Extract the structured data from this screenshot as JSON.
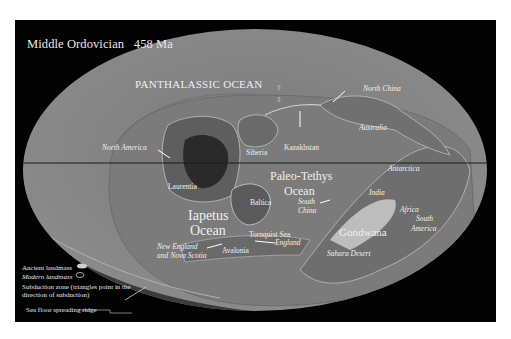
{
  "title": "Middle Ordovician   458 Ma",
  "colors": {
    "background": "#020202",
    "outer_ocean": "#888888",
    "inner_ocean": "#787878",
    "land": "#6a6a6a",
    "ancient_land_dark": "#2e2e2e",
    "gondwana_light": "#bdbdbd",
    "label": "#efefef",
    "equator_line": "#1a1a1a"
  },
  "oceans": {
    "panthalassic": "PANTHALASSIC OCEAN",
    "paleo_tethys_1": "Paleo-Tethys",
    "paleo_tethys_2": "Ocean",
    "iapetus_1": "Iapetus",
    "iapetus_2": "Ocean",
    "tornquist": "Tornquist Sea"
  },
  "ancient_landmasses": {
    "laurentia": "Laurentia",
    "siberia": "Siberia",
    "kazakhstan": "Kazakhstan",
    "baltica": "Baltica",
    "avalonia": "Avalonia",
    "gondwana": "Gondwana"
  },
  "modern_landmasses": {
    "north_america": "North America",
    "north_china": "North China",
    "australia": "Australia",
    "antarctica": "Antarctica",
    "india": "India",
    "south_china_1": "South",
    "south_china_2": "China",
    "africa": "Africa",
    "south_america_1": "South",
    "south_america_2": "America",
    "england": "England",
    "new_england_1": "New England",
    "new_england_2": "and Nova Scotia",
    "sahara": "Sahara Desert"
  },
  "legend": {
    "ancient": "Ancient landmass",
    "modern": "Modern landmass",
    "subduction_1": "Subduction zone (triangles point in the",
    "subduction_2": "direction of subduction)",
    "ridge": "Sea floor spreading ridge"
  }
}
